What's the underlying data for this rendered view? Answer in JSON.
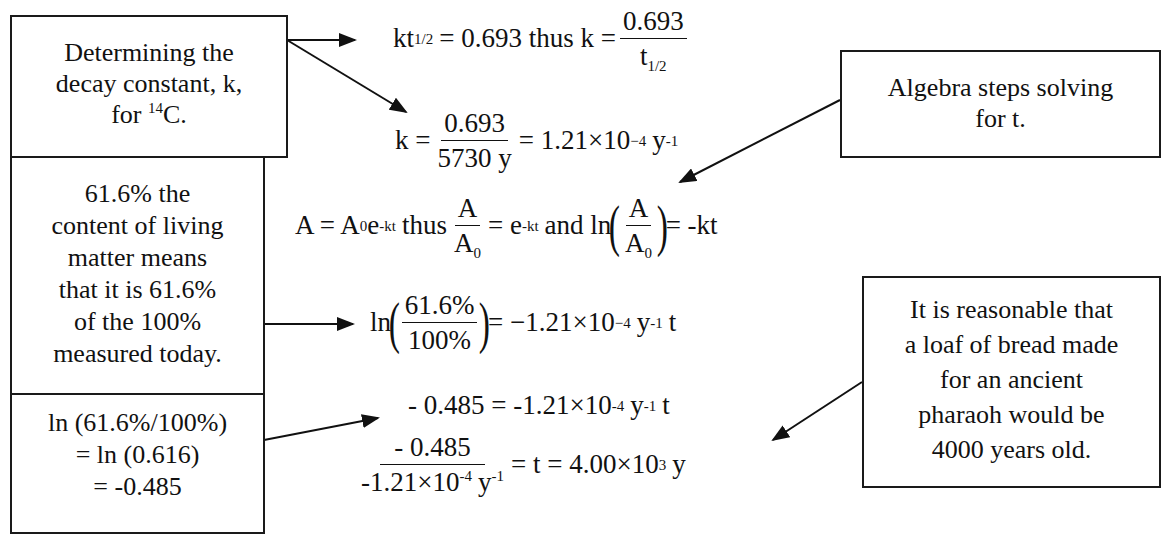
{
  "boxes": {
    "decay_constant": {
      "lines": [
        "Determining the",
        "decay constant, k,"
      ],
      "line3_prefix": "for ",
      "isotope_mass": "14",
      "isotope_symbol": "C."
    },
    "percent_meaning": {
      "lines": [
        "61.6% the",
        "content of living",
        "matter means",
        "that it is 61.6%",
        "of the 100%",
        "measured today."
      ]
    },
    "ln_calc": {
      "lines": [
        "ln (61.6%/100%)",
        "= ln (0.616)",
        "= -0.485"
      ]
    },
    "algebra": {
      "lines": [
        "Algebra steps solving",
        "for t."
      ]
    },
    "conclusion": {
      "lines": [
        "It is reasonable that",
        "a loaf of bread made",
        "for an ancient",
        "pharaoh would be",
        "4000 years old."
      ]
    }
  },
  "equations": {
    "eq1": {
      "lhs": "kt",
      "lhs_sub": "1/2",
      "mid": "= 0.693 thus k =",
      "frac_num": "0.693",
      "frac_den": "t",
      "frac_den_sub": "1/2"
    },
    "eq2": {
      "lhs": "k =",
      "frac_num": "0.693",
      "frac_den": "5730 y",
      "rhs": "= 1.21×10",
      "rhs_exp": "−4",
      "unit": "y",
      "unit_exp": "-1"
    },
    "eq3": {
      "p1": "A = A",
      "p1_sub": "0",
      "p2": "e",
      "p2_exp": "-kt",
      "p3": "thus",
      "frac1_num": "A",
      "frac1_den": "A",
      "frac1_den_sub": "0",
      "p4": "= e",
      "p4_exp": "-kt",
      "p5": "and ln",
      "frac2_num": "A",
      "frac2_den": "A",
      "frac2_den_sub": "0",
      "p6": "= -kt"
    },
    "eq4": {
      "lhs": "ln",
      "frac_num": "61.6%",
      "frac_den": "100%",
      "rhs": "= −1.21×10",
      "rhs_exp": "−4",
      "unit": "y",
      "unit_exp": "-1",
      "var": "t"
    },
    "eq5": {
      "lhs": "- 0.485 = -1.21×10",
      "exp": "-4",
      "unit": "y",
      "unit_exp": "-1",
      "var": "t"
    },
    "eq6": {
      "frac_num": "- 0.485",
      "frac_den": "-1.21×10",
      "frac_den_exp": "-4",
      "frac_den_unit": "y",
      "frac_den_unit_exp": "-1",
      "rhs": "= t = 4.00×10",
      "rhs_exp": "3",
      "unit": "y"
    }
  },
  "colors": {
    "ink": "#111111",
    "background": "#ffffff"
  }
}
